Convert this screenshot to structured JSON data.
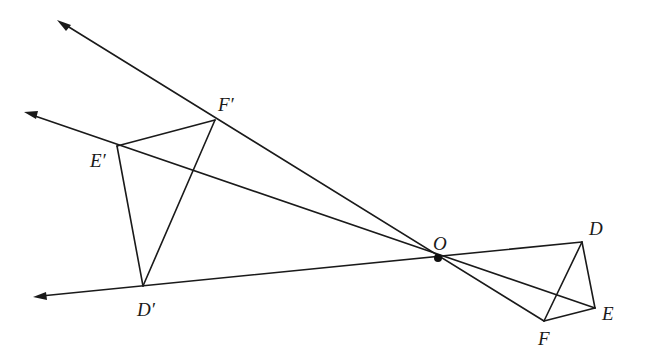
{
  "diagram": {
    "title": "",
    "colors": {
      "stroke": "#1a1a1a",
      "background": "#ffffff"
    },
    "center": {
      "label": "O",
      "x": 438,
      "y": 258
    },
    "points": {
      "D": {
        "label": "D",
        "x": 582,
        "y": 242
      },
      "E": {
        "label": "E",
        "x": 595,
        "y": 308
      },
      "F": {
        "label": "F",
        "x": 544,
        "y": 321
      },
      "D_prime": {
        "label": "D′",
        "x": 143,
        "y": 286
      },
      "E_prime": {
        "label": "E′",
        "x": 117,
        "y": 146
      },
      "F_prime": {
        "label": "F′",
        "x": 215,
        "y": 120
      }
    },
    "rays": [
      {
        "name": "ray-through-F",
        "from": "F",
        "tip": {
          "x": 58,
          "y": 20
        }
      },
      {
        "name": "ray-through-E",
        "from": "E",
        "tip": {
          "x": 25,
          "y": 113
        }
      },
      {
        "name": "ray-through-D",
        "from": "D",
        "tip": {
          "x": 34,
          "y": 297
        }
      }
    ],
    "triangles": [
      {
        "name": "original",
        "vertices": [
          "D",
          "E",
          "F"
        ],
        "extra_segments": [
          [
            "D",
            "F"
          ]
        ]
      },
      {
        "name": "image",
        "vertices": [
          "D_prime",
          "E_prime",
          "F_prime"
        ]
      }
    ],
    "labels": {
      "D": {
        "text": "D",
        "x": 589,
        "y": 235
      },
      "E": {
        "text": "E",
        "x": 602,
        "y": 320
      },
      "F": {
        "text": "F",
        "x": 538,
        "y": 345
      },
      "O": {
        "text": "O",
        "x": 433,
        "y": 250
      },
      "D_prime": {
        "text": "D′",
        "x": 137,
        "y": 316
      },
      "E_prime": {
        "text": "E′",
        "x": 90,
        "y": 167
      },
      "F_prime": {
        "text": "F′",
        "x": 218,
        "y": 111
      }
    }
  }
}
